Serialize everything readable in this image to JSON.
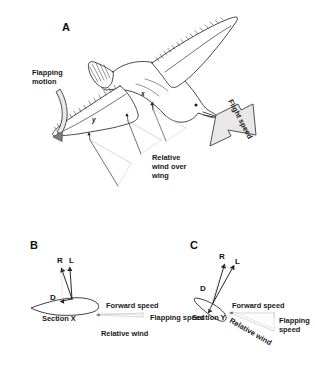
{
  "figure": {
    "background_color": "#ffffff",
    "ink_color": "#1a1a1a",
    "faint_color": "#bdbdbd"
  },
  "panels": [
    {
      "id": "A",
      "letter": "A",
      "subject": "gull-in-flapping-flight",
      "labels": {
        "flapping_motion_line1": "Flapping",
        "flapping_motion_line2": "motion",
        "flight_speed": "Flight speed",
        "relative_wind_line1": "Relative",
        "relative_wind_line2": "wind over",
        "relative_wind_line3": "wing"
      },
      "section_markers": [
        {
          "name": "x",
          "label": "x"
        },
        {
          "name": "y",
          "label": "y"
        }
      ]
    },
    {
      "id": "B",
      "letter": "B",
      "subject": "wing-section-x-velocity-diagram",
      "section_label": "Section X",
      "vectors": [
        {
          "name": "resultant",
          "label": "R"
        },
        {
          "name": "lift",
          "label": "L"
        },
        {
          "name": "drag",
          "label": "D"
        }
      ],
      "speed_labels": {
        "forward_speed": "Forward speed",
        "flapping_speed": "Flapping speed",
        "relative_wind": "Relative wind"
      }
    },
    {
      "id": "C",
      "letter": "C",
      "subject": "wing-section-y-velocity-diagram",
      "section_label": "Section Y",
      "vectors": [
        {
          "name": "resultant",
          "label": "R"
        },
        {
          "name": "lift",
          "label": "L"
        },
        {
          "name": "drag",
          "label": "D"
        }
      ],
      "speed_labels": {
        "forward_speed": "Forward speed",
        "flapping_speed_line1": "Flapping",
        "flapping_speed_line2": "speed",
        "relative_wind": "Relative wind"
      }
    }
  ]
}
